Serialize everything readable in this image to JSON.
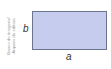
{
  "credit": {
    "line1": "Banco de imagens/",
    "line2": "Arquivo da editora"
  },
  "diagram": {
    "shape": "rectangle",
    "fill_color": "#c6cced",
    "border_color": "#6b7590",
    "height_label": "b",
    "width_label": "a"
  }
}
